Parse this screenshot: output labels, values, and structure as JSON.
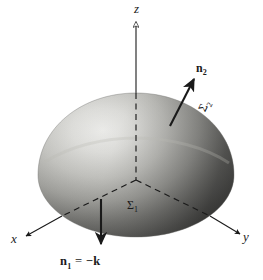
{
  "figure": {
    "kind": "3d-geometry-diagram",
    "background_color": "#ffffff",
    "ink_color": "#1a1a1a"
  },
  "axes": {
    "x": {
      "label": "x",
      "style": "italic"
    },
    "y": {
      "label": "y",
      "style": "italic"
    },
    "z": {
      "label": "z",
      "style": "italic"
    }
  },
  "surfaces": {
    "bottom": {
      "label": "Σ",
      "subscript": "1"
    },
    "dome": {
      "label": "Σ",
      "subscript": "2"
    }
  },
  "normals": {
    "upper": {
      "label": "n",
      "subscript": "2"
    },
    "lower": {
      "label": "n",
      "subscript": "1",
      "equals": "=",
      "value": "−k"
    }
  },
  "shading": {
    "highlight": "#f2f2f0",
    "midtone": "#a9a9a6",
    "shadow": "#4a4a48",
    "deep_shadow": "#2e2e2d"
  }
}
